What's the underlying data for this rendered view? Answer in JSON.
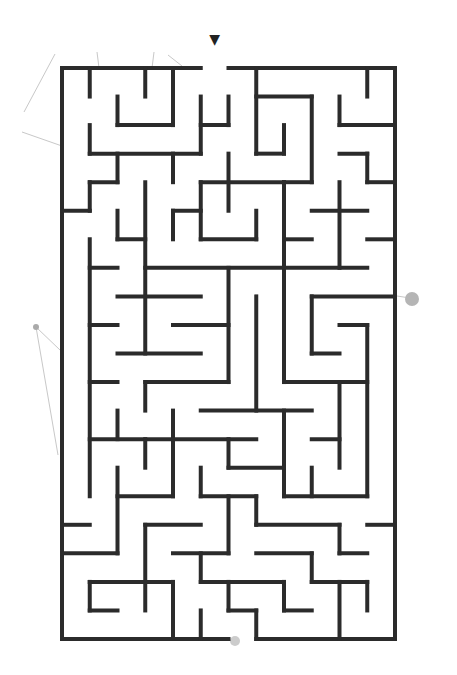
{
  "puzzle": {
    "type": "maze",
    "title": "Maze",
    "cols": 12,
    "rows": 20,
    "origin": [
      62,
      68
    ],
    "cell_w": 27.75,
    "cell_h": 28.55,
    "wall_color": "#2b2b2b",
    "wall_width": 4,
    "entrance": {
      "col": 5,
      "side": "top",
      "marker": "▼",
      "marker_color": "#222222"
    },
    "exit": {
      "col": 6,
      "side": "bottom",
      "marker_color": "#bbbbbb"
    },
    "walls": [
      [
        0,
        0,
        5,
        0
      ],
      [
        6,
        0,
        12,
        0
      ],
      [
        0,
        0,
        0,
        20
      ],
      [
        12,
        0,
        12,
        20
      ],
      [
        0,
        20,
        6,
        20
      ],
      [
        7,
        20,
        12,
        20
      ],
      [
        1,
        0,
        1,
        1
      ],
      [
        3,
        0,
        3,
        1
      ],
      [
        4,
        0,
        4,
        2
      ],
      [
        2,
        1,
        2,
        2
      ],
      [
        2,
        2,
        4,
        2
      ],
      [
        5,
        1,
        5,
        3
      ],
      [
        5,
        2,
        6,
        2
      ],
      [
        6,
        1,
        6,
        2
      ],
      [
        1,
        2,
        1,
        3
      ],
      [
        1,
        3,
        5,
        3
      ],
      [
        2,
        3,
        2,
        4
      ],
      [
        1,
        4,
        2,
        4
      ],
      [
        4,
        3,
        4,
        4
      ],
      [
        7,
        0,
        7,
        3
      ],
      [
        7,
        3,
        8,
        3
      ],
      [
        8,
        2,
        8,
        3
      ],
      [
        7,
        1,
        9,
        1
      ],
      [
        9,
        1,
        9,
        4
      ],
      [
        10,
        1,
        10,
        2
      ],
      [
        10,
        2,
        12,
        2
      ],
      [
        11,
        0,
        11,
        1
      ],
      [
        10,
        3,
        11,
        3
      ],
      [
        11,
        3,
        11,
        4
      ],
      [
        11,
        4,
        12,
        4
      ],
      [
        6,
        3,
        6,
        5
      ],
      [
        5,
        4,
        8,
        4
      ],
      [
        8,
        4,
        8,
        11
      ],
      [
        8,
        4,
        9,
        4
      ],
      [
        1,
        4,
        1,
        5
      ],
      [
        0,
        5,
        1,
        5
      ],
      [
        3,
        4,
        3,
        10
      ],
      [
        2,
        5,
        2,
        6
      ],
      [
        2,
        6,
        3,
        6
      ],
      [
        4,
        5,
        5,
        5
      ],
      [
        4,
        5,
        4,
        6
      ],
      [
        5,
        4,
        5,
        6
      ],
      [
        5,
        6,
        7,
        6
      ],
      [
        7,
        5,
        7,
        6
      ],
      [
        8,
        6,
        9,
        6
      ],
      [
        10,
        4,
        10,
        7
      ],
      [
        9,
        5,
        11,
        5
      ],
      [
        11,
        6,
        12,
        6
      ],
      [
        1,
        6,
        1,
        15
      ],
      [
        1,
        7,
        2,
        7
      ],
      [
        3,
        7,
        11,
        7
      ],
      [
        6,
        7,
        6,
        11
      ],
      [
        2,
        8,
        5,
        8
      ],
      [
        7,
        8,
        7,
        12
      ],
      [
        9,
        8,
        12,
        8
      ],
      [
        9,
        8,
        9,
        10
      ],
      [
        9,
        10,
        10,
        10
      ],
      [
        1,
        9,
        2,
        9
      ],
      [
        4,
        9,
        6,
        9
      ],
      [
        10,
        9,
        11,
        9
      ],
      [
        11,
        9,
        11,
        15
      ],
      [
        2,
        10,
        5,
        10
      ],
      [
        1,
        11,
        2,
        11
      ],
      [
        3,
        11,
        6,
        11
      ],
      [
        3,
        11,
        3,
        12
      ],
      [
        8,
        11,
        11,
        11
      ],
      [
        10,
        11,
        10,
        14
      ],
      [
        2,
        12,
        2,
        13
      ],
      [
        4,
        12,
        4,
        15
      ],
      [
        5,
        12,
        9,
        12
      ],
      [
        8,
        12,
        8,
        15
      ],
      [
        1,
        13,
        7,
        13
      ],
      [
        6,
        13,
        6,
        14
      ],
      [
        6,
        14,
        8,
        14
      ],
      [
        3,
        13,
        3,
        14
      ],
      [
        9,
        13,
        10,
        13
      ],
      [
        9,
        14,
        9,
        15
      ],
      [
        2,
        14,
        2,
        17
      ],
      [
        5,
        14,
        5,
        15
      ],
      [
        2,
        15,
        4,
        15
      ],
      [
        5,
        15,
        7,
        15
      ],
      [
        7,
        15,
        7,
        16
      ],
      [
        7,
        16,
        10,
        16
      ],
      [
        8,
        15,
        11,
        15
      ],
      [
        6,
        15,
        6,
        17
      ],
      [
        0,
        16,
        1,
        16
      ],
      [
        3,
        16,
        5,
        16
      ],
      [
        3,
        16,
        3,
        19
      ],
      [
        11,
        16,
        12,
        16
      ],
      [
        10,
        16,
        10,
        17
      ],
      [
        10,
        17,
        11,
        17
      ],
      [
        0,
        17,
        2,
        17
      ],
      [
        4,
        17,
        6,
        17
      ],
      [
        7,
        17,
        9,
        17
      ],
      [
        9,
        17,
        9,
        18
      ],
      [
        9,
        18,
        11,
        18
      ],
      [
        11,
        18,
        11,
        19
      ],
      [
        5,
        17,
        5,
        18
      ],
      [
        5,
        18,
        8,
        18
      ],
      [
        8,
        18,
        8,
        19
      ],
      [
        8,
        19,
        9,
        19
      ],
      [
        10,
        18,
        10,
        20
      ],
      [
        1,
        18,
        4,
        18
      ],
      [
        1,
        18,
        1,
        19
      ],
      [
        1,
        19,
        2,
        19
      ],
      [
        4,
        18,
        4,
        20
      ],
      [
        5,
        19,
        5,
        20
      ],
      [
        6,
        18,
        6,
        19
      ],
      [
        6,
        19,
        7,
        19
      ],
      [
        7,
        19,
        7,
        20
      ]
    ]
  },
  "decorations": {
    "color": "#c8c8c8",
    "lines": [
      [
        55,
        54,
        24,
        112
      ],
      [
        22,
        132,
        62,
        146
      ],
      [
        97,
        52,
        99,
        68
      ],
      [
        154,
        52,
        152,
        68
      ],
      [
        168,
        55,
        182,
        66
      ],
      [
        36,
        327,
        60,
        350
      ],
      [
        36,
        327,
        58,
        455
      ],
      [
        397,
        296,
        410,
        298
      ]
    ],
    "dots": [
      {
        "x": 36,
        "y": 327,
        "r": 3,
        "color": "#aaaaaa"
      },
      {
        "x": 412,
        "y": 299,
        "r": 7,
        "color": "#b5b5b5"
      },
      {
        "x": 235,
        "y": 641,
        "r": 5,
        "color": "#cccccc"
      }
    ]
  }
}
